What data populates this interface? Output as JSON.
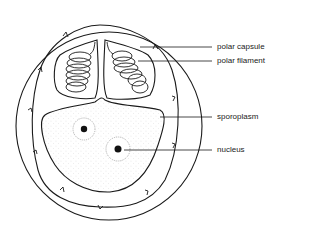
{
  "diagram": {
    "labels": [
      {
        "id": "polar-capsule",
        "text": "polar capsule",
        "y": 47
      },
      {
        "id": "polar-filament",
        "text": "polar filament",
        "y": 61
      },
      {
        "id": "sporoplasm",
        "text": "sporoplasm",
        "y": 117
      },
      {
        "id": "nucleus",
        "text": "nucleus",
        "y": 150
      }
    ],
    "colors": {
      "line": "#1a1a1a",
      "background": "#ffffff",
      "stipple": "#9a9a9a"
    }
  }
}
